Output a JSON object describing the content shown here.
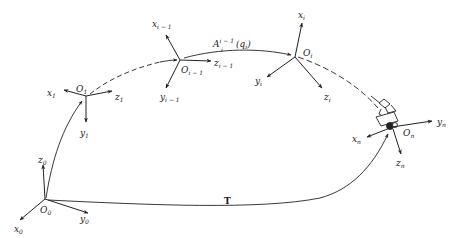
{
  "diagram": {
    "type": "coordinate-frame-chain",
    "colors": {
      "ink": "#222222",
      "background": "#ffffff"
    },
    "frames": [
      {
        "id": "frame-0",
        "origin": "O",
        "origin_sub": "0",
        "axes": [
          {
            "name": "z",
            "sub": "0"
          },
          {
            "name": "x",
            "sub": "0"
          },
          {
            "name": "y",
            "sub": "0"
          }
        ]
      },
      {
        "id": "frame-1",
        "origin": "O",
        "origin_sub": "1",
        "axes": [
          {
            "name": "x",
            "sub": "1"
          },
          {
            "name": "z",
            "sub": "1"
          },
          {
            "name": "y",
            "sub": "1"
          }
        ]
      },
      {
        "id": "frame-i-1",
        "origin": "O",
        "origin_sub": "i − 1",
        "axes": [
          {
            "name": "x",
            "sub": "i − 1"
          },
          {
            "name": "z",
            "sub": "i − 1"
          },
          {
            "name": "y",
            "sub": "i − 1"
          }
        ]
      },
      {
        "id": "frame-i",
        "origin": "O",
        "origin_sub": "i",
        "axes": [
          {
            "name": "x",
            "sub": "i"
          },
          {
            "name": "y",
            "sub": "i"
          },
          {
            "name": "z",
            "sub": "i"
          }
        ]
      },
      {
        "id": "frame-n",
        "origin": "O",
        "origin_sub": "n",
        "axes": [
          {
            "name": "y",
            "sub": "n"
          },
          {
            "name": "x",
            "sub": "n"
          },
          {
            "name": "z",
            "sub": "n"
          }
        ]
      }
    ],
    "transform_label": {
      "base": "A",
      "sup": "i − 1",
      "sub": "i",
      "arg": "(q",
      "arg_sub": "i",
      "arg_close": ")"
    },
    "total_transform_label": "T",
    "links": [
      {
        "from": "frame-0",
        "to": "frame-1",
        "style": "solid"
      },
      {
        "from": "frame-1",
        "to": "frame-i-1",
        "style": "dashed"
      },
      {
        "from": "frame-i-1",
        "to": "frame-i",
        "style": "solid",
        "label": "A^{i-1}_i(q_i)"
      },
      {
        "from": "frame-i",
        "to": "frame-n",
        "style": "dashed"
      },
      {
        "from": "frame-0",
        "to": "frame-n",
        "style": "solid",
        "label": "T"
      }
    ],
    "end_effector": "gripper"
  }
}
